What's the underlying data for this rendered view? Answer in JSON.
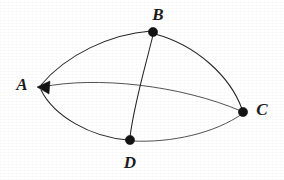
{
  "figure": {
    "kind": "graph-diagram",
    "width": 284,
    "height": 180,
    "background_color": "#ffffff",
    "stroke_color": "#262626",
    "label_color": "#1b1b1b"
  },
  "vertices": [
    {
      "id": "A",
      "label": "A",
      "marker": "arrowhead",
      "x": 38,
      "y": 87,
      "label_x": 22,
      "label_y": 84
    },
    {
      "id": "B",
      "label": "B",
      "marker": "dot",
      "x": 153,
      "y": 32,
      "label_x": 158,
      "label_y": 14
    },
    {
      "id": "C",
      "label": "C",
      "marker": "dot",
      "x": 243,
      "y": 112,
      "label_x": 262,
      "label_y": 109
    },
    {
      "id": "D",
      "label": "D",
      "marker": "dot",
      "x": 130,
      "y": 140,
      "label_x": 130,
      "label_y": 162
    }
  ],
  "edges": [
    {
      "id": "AB",
      "from": "A",
      "to": "B",
      "curve": "bulge-up",
      "path": "M 41 85 C 66 55, 110 34, 151 31"
    },
    {
      "id": "BC",
      "from": "B",
      "to": "C",
      "curve": "bulge-right",
      "path": "M 155 34 C 196 45, 230 76, 242 109"
    },
    {
      "id": "AC",
      "from": "A",
      "to": "C",
      "curve": "bulge-up-slight",
      "path": "M 42 87 C 96 76, 180 85, 241 111"
    },
    {
      "id": "AD",
      "from": "A",
      "to": "D",
      "curve": "bulge-down",
      "path": "M 41 90 C 54 116, 90 137, 128 140"
    },
    {
      "id": "DC",
      "from": "D",
      "to": "C",
      "curve": "bulge-down-slight",
      "path": "M 132 141 C 172 143, 215 133, 242 114"
    },
    {
      "id": "BD",
      "from": "B",
      "to": "D",
      "curve": "near-straight",
      "path": "M 153 35 C 145 68, 134 104, 130 137"
    }
  ]
}
